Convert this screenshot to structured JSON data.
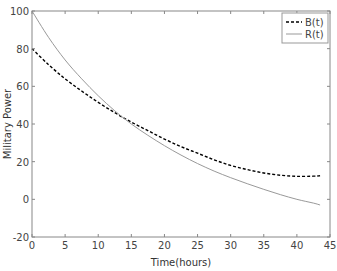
{
  "chart_data": {
    "type": "line",
    "title": "",
    "xlabel": "Time(hours)",
    "ylabel": "Military Power",
    "xlim": [
      0,
      45
    ],
    "ylim": [
      -20,
      100
    ],
    "xticks": [
      0,
      5,
      10,
      15,
      20,
      25,
      30,
      35,
      40,
      45
    ],
    "yticks": [
      -20,
      0,
      20,
      40,
      60,
      80,
      100
    ],
    "grid": false,
    "legend_position": "upper right",
    "series": [
      {
        "name": "B(t)",
        "style": "dashed",
        "color": "#000000",
        "x": [
          0,
          2.5,
          5,
          7.5,
          10,
          12.5,
          15,
          17.5,
          20,
          22.5,
          25,
          27.5,
          30,
          32.5,
          35,
          37.5,
          40,
          42.5,
          43.5
        ],
        "y": [
          80,
          71.5,
          64,
          57.5,
          51.5,
          46,
          41,
          36.5,
          32,
          28,
          24.5,
          21,
          18,
          15.8,
          14,
          12.8,
          12.2,
          12.3,
          12.5
        ]
      },
      {
        "name": "R(t)",
        "style": "solid",
        "color": "#999999",
        "x": [
          0,
          2.5,
          5,
          7.5,
          10,
          12.5,
          15,
          17.5,
          20,
          22.5,
          25,
          27.5,
          30,
          32.5,
          35,
          37.5,
          40,
          42.5,
          43.5
        ],
        "y": [
          100,
          86,
          74,
          64,
          55,
          47,
          40,
          34,
          28.5,
          23.5,
          19,
          15,
          11.5,
          8.3,
          5.3,
          2.5,
          0,
          -2,
          -3
        ]
      }
    ]
  },
  "legend": {
    "items": [
      {
        "label": "B(t)"
      },
      {
        "label": "R(t)"
      }
    ]
  }
}
